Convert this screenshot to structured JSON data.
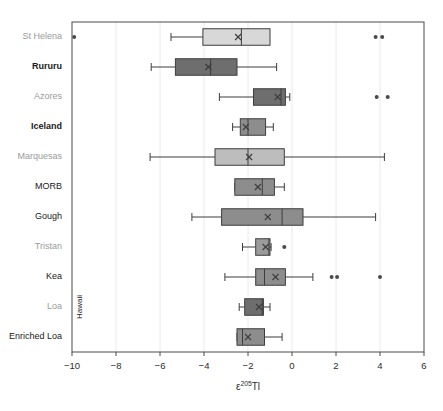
{
  "chart_data": {
    "type": "box",
    "title": "",
    "xlabel": "ε²⁰⁵Tl",
    "xlabel_parts": {
      "symbol": "ε",
      "superscript": "205",
      "element": "Tl"
    },
    "ylabel": "",
    "xlim": [
      -10,
      6
    ],
    "xticks": [
      -10,
      -8,
      -6,
      -4,
      -2,
      0,
      2,
      4,
      6
    ],
    "xtick_labels": [
      "−10",
      "−8",
      "−6",
      "−4",
      "−2",
      "0",
      "2",
      "4",
      "6"
    ],
    "grid": "vertical-light",
    "legend": "none",
    "group_bracket_label": "Hawaii",
    "categories": [
      "St Helena",
      "Rururu",
      "Azores",
      "Iceland",
      "Marquesas",
      "MORB",
      "Gough",
      "Tristan",
      "Kea",
      "Loa",
      "Enriched Loa"
    ],
    "boxes": [
      {
        "label": "St Helena",
        "label_color": "#9a9a9a",
        "label_weight": "normal",
        "fill": "#d8d8d8",
        "whisker_low": -5.5,
        "q1": -4.05,
        "median": -2.3,
        "q3": -1.0,
        "whisker_high": -1.35,
        "mean": -2.45,
        "outliers": [
          -9.9,
          3.8,
          4.1
        ]
      },
      {
        "label": "Rururu",
        "label_color": "#1a1a1a",
        "label_weight": "bold",
        "fill": "#6e6e6e",
        "whisker_low": -6.4,
        "q1": -5.3,
        "median": -3.7,
        "q3": -2.5,
        "whisker_high": -0.7,
        "mean": -3.8,
        "outliers": []
      },
      {
        "label": "Azores",
        "label_color": "#9a9a9a",
        "label_weight": "normal",
        "fill": "#6e6e6e",
        "whisker_low": -3.3,
        "q1": -1.75,
        "median": -0.5,
        "q3": -0.3,
        "whisker_high": -0.1,
        "mean": -0.65,
        "outliers": [
          3.85,
          4.35
        ]
      },
      {
        "label": "Iceland",
        "label_color": "#1a1a1a",
        "label_weight": "bold",
        "fill": "#8d8d8d",
        "whisker_low": -2.7,
        "q1": -2.35,
        "median": -2.0,
        "q3": -1.2,
        "whisker_high": -0.85,
        "mean": -2.1,
        "outliers": []
      },
      {
        "label": "Marquesas",
        "label_color": "#9a9a9a",
        "label_weight": "normal",
        "fill": "#bdbdbd",
        "whisker_low": -6.45,
        "q1": -3.5,
        "median": -2.0,
        "q3": -0.35,
        "whisker_high": 4.2,
        "mean": -1.95,
        "outliers": []
      },
      {
        "label": "MORB",
        "label_color": "#1a1a1a",
        "label_weight": "normal",
        "fill": "#8d8d8d",
        "whisker_low": -2.6,
        "q1": -2.6,
        "median": -1.35,
        "q3": -0.8,
        "whisker_high": -0.35,
        "mean": -1.55,
        "outliers": []
      },
      {
        "label": "Gough",
        "label_color": "#1a1a1a",
        "label_weight": "normal",
        "fill": "#8d8d8d",
        "whisker_low": -4.55,
        "q1": -3.2,
        "median": -0.45,
        "q3": 0.5,
        "whisker_high": 3.8,
        "mean": -1.1,
        "outliers": []
      },
      {
        "label": "Tristan",
        "label_color": "#9a9a9a",
        "label_weight": "normal",
        "fill": "#9b9b9b",
        "whisker_low": -2.25,
        "q1": -1.65,
        "median": -1.05,
        "q3": -1.0,
        "whisker_high": -0.95,
        "mean": -1.2,
        "outliers": [
          -0.35
        ]
      },
      {
        "label": "Kea",
        "label_color": "#1a1a1a",
        "label_weight": "normal",
        "fill": "#8d8d8d",
        "whisker_low": -3.05,
        "q1": -1.65,
        "median": -1.25,
        "q3": -0.3,
        "whisker_high": 0.95,
        "mean": -0.75,
        "outliers": [
          1.8,
          2.05,
          4.0
        ]
      },
      {
        "label": "Loa",
        "label_color": "#9a9a9a",
        "label_weight": "normal",
        "fill": "#6e6e6e",
        "whisker_low": -2.4,
        "q1": -2.15,
        "median": -1.35,
        "q3": -1.3,
        "whisker_high": -1.0,
        "mean": -1.5,
        "outliers": []
      },
      {
        "label": "Enriched Loa",
        "label_color": "#1a1a1a",
        "label_weight": "normal",
        "fill": "#8d8d8d",
        "whisker_low": -2.5,
        "q1": -2.5,
        "median": -2.25,
        "q3": -1.25,
        "whisker_high": -0.45,
        "mean": -2.0,
        "outliers": []
      }
    ],
    "hawaii_group": [
      "Kea",
      "Loa",
      "Enriched Loa"
    ]
  },
  "colors": {
    "frame": "#4a4a4a",
    "grid": "#e4e4e4",
    "stroke": "#3d3d3d",
    "background": "#ffffff",
    "label_gray": "#9a9a9a",
    "label_dark": "#1a1a1a"
  }
}
